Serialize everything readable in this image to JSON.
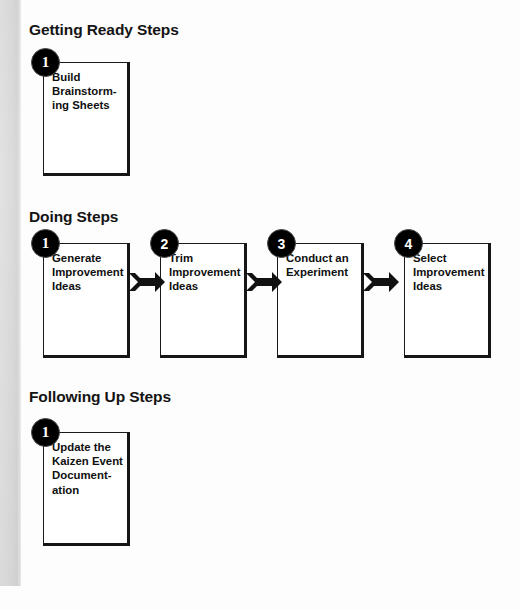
{
  "diagram": {
    "background_color": "#fdfdfd",
    "ink_color": "#111111",
    "badge_color": "#000000",
    "badge_text_color": "#ffffff",
    "scan_band_color": "#dcdcdc"
  },
  "sections": [
    {
      "id": "getting-ready",
      "heading": "Getting Ready Steps",
      "steps": [
        {
          "number": "1",
          "text": "Build\nBrainstorm-\ning Sheets"
        }
      ]
    },
    {
      "id": "doing",
      "heading": "Doing Steps",
      "steps": [
        {
          "number": "1",
          "text": "Generate\nImprovement\nIdeas"
        },
        {
          "number": "2",
          "text": "Trim\nImprovement\nIdeas"
        },
        {
          "number": "3",
          "text": "Conduct an\nExperiment"
        },
        {
          "number": "4",
          "text": "Select\nImprovement\nIdeas"
        }
      ],
      "connectors": [
        {
          "from": "1",
          "to": "2",
          "icon": "arrow-right-icon"
        },
        {
          "from": "2",
          "to": "3",
          "icon": "arrow-right-icon"
        },
        {
          "from": "3",
          "to": "4",
          "icon": "arrow-right-icon"
        }
      ]
    },
    {
      "id": "following-up",
      "heading": "Following Up Steps",
      "steps": [
        {
          "number": "1",
          "text": "Update the\nKaizen Event\nDocument-\nation"
        }
      ]
    }
  ]
}
